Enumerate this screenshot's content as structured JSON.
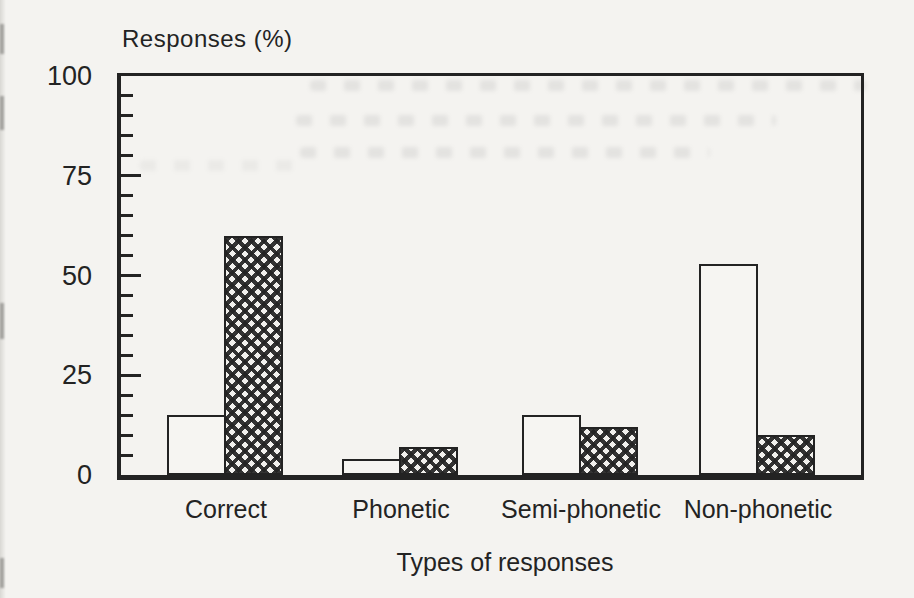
{
  "colors": {
    "paper": "#f4f3f0",
    "ink": "#232323",
    "bleedthrough": "#9a9a9a"
  },
  "chart_data": {
    "type": "bar",
    "title": "Responses (%)",
    "xlabel": "Types of responses",
    "ylabel": "Responses (%)",
    "categories": [
      "Correct",
      "Phonetic",
      "Semi-phonetic",
      "Non-phonetic"
    ],
    "series": [
      {
        "name": "open-bar",
        "pattern": "plain-white",
        "values": [
          15,
          4,
          15,
          53
        ]
      },
      {
        "name": "hatched-bar",
        "pattern": "crosshatch",
        "values": [
          60,
          7,
          12,
          10
        ]
      }
    ],
    "ylim": [
      0,
      100
    ],
    "yticks": [
      0,
      25,
      50,
      75,
      100
    ],
    "minor_tick_step": 5,
    "grid": false,
    "legend": "none"
  }
}
